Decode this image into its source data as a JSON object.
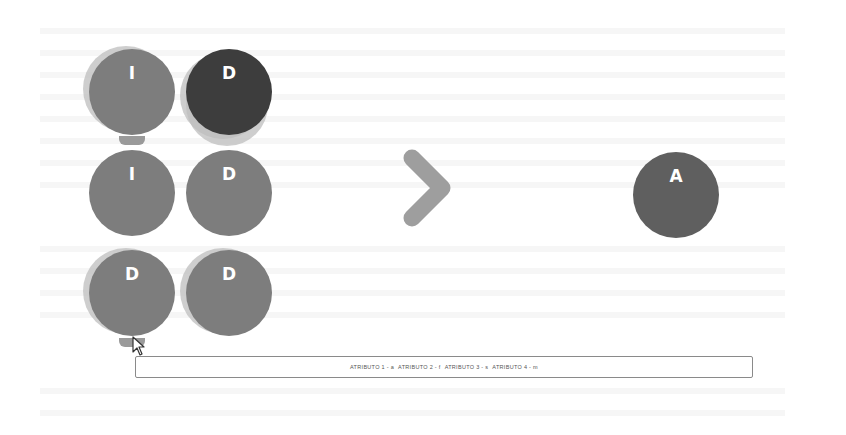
{
  "grid": {
    "tokens": [
      {
        "label": "I",
        "shade": "medium",
        "row": 1,
        "col": 1
      },
      {
        "label": "D",
        "shade": "dark",
        "row": 1,
        "col": 2
      },
      {
        "label": "I",
        "shade": "medium",
        "row": 2,
        "col": 1
      },
      {
        "label": "D",
        "shade": "medium",
        "row": 2,
        "col": 2
      },
      {
        "label": "D",
        "shade": "medium",
        "row": 3,
        "col": 1
      },
      {
        "label": "D",
        "shade": "medium",
        "row": 3,
        "col": 2
      }
    ]
  },
  "arrow": {
    "icon": "chevron-right-icon"
  },
  "result": {
    "label": "A"
  },
  "attributes": {
    "items": [
      "ATRIBUTO 1 - a",
      "ATRIBUTO 2 - f",
      "ATRIBUTO 3 - s",
      "ATRIBUTO 4 - m"
    ]
  },
  "colors": {
    "token_medium": "#7d7d7d",
    "token_dark": "#3d3d3d",
    "result_token": "#5f5f5f",
    "chevron": "#9e9e9e",
    "background": "#ffffff"
  }
}
